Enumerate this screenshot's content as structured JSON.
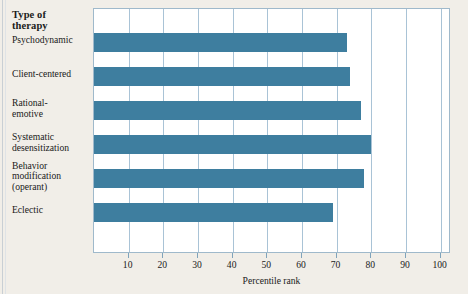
{
  "figure": {
    "axis_heading": "Type of\ntherapy",
    "axis_heading_line1": "Type of",
    "axis_heading_line2": "therapy",
    "background_color": "#f1eee8",
    "plot_background_color": "#ffffff",
    "bar_color": "#3e7e9f",
    "grid_color": "#a9c3d6",
    "frame_color": "#9fb9cb"
  },
  "chart_data": {
    "type": "bar",
    "orientation": "horizontal",
    "title": "",
    "xlabel": "Percentile rank",
    "ylabel": "Type of therapy",
    "categories": [
      "Psychodynamic",
      "Client-centered",
      "Rational-emotive",
      "Systematic desensitization",
      "Behavior modification (operant)",
      "Eclectic"
    ],
    "category_lines": [
      [
        "Psychodynamic"
      ],
      [
        "Client-centered"
      ],
      [
        "Rational-",
        "emotive"
      ],
      [
        "Systematic",
        "desensitization"
      ],
      [
        "Behavior",
        "modification",
        "(operant)"
      ],
      [
        "Eclectic"
      ]
    ],
    "values": [
      73,
      74,
      77,
      80,
      78,
      69
    ],
    "xlim": [
      0,
      103
    ],
    "xticks": [
      10,
      20,
      30,
      40,
      50,
      60,
      70,
      80,
      90,
      100
    ],
    "xtick_labels": [
      "10",
      "20",
      "30",
      "40",
      "50",
      "60",
      "70",
      "80",
      "90",
      "100"
    ],
    "grid": "vertical",
    "legend": "none"
  }
}
